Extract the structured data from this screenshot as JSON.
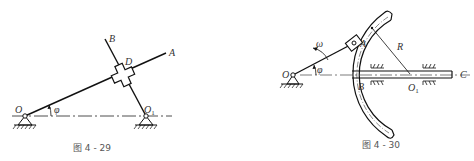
{
  "figures": [
    {
      "id": "fig-4-29",
      "caption": "图 4 - 29",
      "labels": {
        "O": "O",
        "O1": "O",
        "O1_sub": "1",
        "A": "A",
        "B": "B",
        "D": "D",
        "phi": "φ"
      },
      "description": "Crank OA rotating about fixed pivot O at angle φ to horizontal; rod O1B pivoted at O1; cross slider D joins both rods."
    },
    {
      "id": "fig-4-30",
      "caption": "图 4 - 30",
      "labels": {
        "O": "O",
        "O1": "O",
        "O1_sub": "1",
        "A": "A",
        "B": "B",
        "C": "C",
        "R": "R",
        "omega": "ω",
        "phi": "φ"
      },
      "description": "Crank OA with angular velocity ω at angle φ; slider A in circular slot of radius R centered at O1; slotted body attached to horizontal rod BC moving in guides."
    }
  ],
  "colors": {
    "line": "#1a1a1a",
    "text": "#333333",
    "background": "#ffffff"
  }
}
